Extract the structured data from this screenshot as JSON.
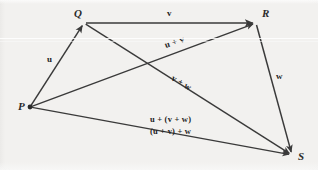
{
  "figure": {
    "background_color": "#f2f1ef",
    "ink_color": "#3a3a3a",
    "vertices": [
      {
        "id": "P",
        "label": "P",
        "x": 30,
        "y": 107,
        "label_x": 18,
        "label_y": 101,
        "dot": true
      },
      {
        "id": "Q",
        "label": "Q",
        "x": 84,
        "y": 23,
        "label_x": 74,
        "label_y": 8,
        "dot": false
      },
      {
        "id": "R",
        "label": "R",
        "x": 256,
        "y": 23,
        "label_x": 262,
        "label_y": 8,
        "dot": false
      },
      {
        "id": "S",
        "label": "S",
        "x": 292,
        "y": 155,
        "label_x": 298,
        "label_y": 151,
        "dot": false
      }
    ],
    "arrows": [
      {
        "id": "u",
        "from": "P",
        "to": "Q"
      },
      {
        "id": "v",
        "from": "Q",
        "to": "R"
      },
      {
        "id": "w",
        "from": "R",
        "to": "S"
      },
      {
        "id": "u+v",
        "from": "P",
        "to": "R"
      },
      {
        "id": "v+w",
        "from": "Q",
        "to": "S"
      },
      {
        "id": "u+(v+w)",
        "from": "P",
        "to": "S"
      }
    ],
    "vector_labels": [
      {
        "id": "u",
        "text": "u",
        "x": 47,
        "y": 55,
        "rotate": 0,
        "size": "normal"
      },
      {
        "id": "v",
        "text": "v",
        "x": 167,
        "y": 9,
        "rotate": 0,
        "size": "normal"
      },
      {
        "id": "w",
        "text": "w",
        "x": 276,
        "y": 72,
        "rotate": 0,
        "size": "normal"
      },
      {
        "id": "u-plus-v",
        "text": "u + v",
        "x": 165,
        "y": 41,
        "rotate": -18,
        "size": "normal"
      },
      {
        "id": "v-plus-w",
        "text": "v + w",
        "x": 172,
        "y": 73,
        "rotate": 31,
        "size": "normal"
      },
      {
        "id": "u-v-w-1",
        "text": "u + (v + w)",
        "x": 150,
        "y": 115,
        "rotate": 0,
        "size": "small"
      },
      {
        "id": "u-v-w-2",
        "text": "(u + v) + w",
        "x": 150,
        "y": 127,
        "rotate": 0,
        "size": "small"
      }
    ]
  }
}
